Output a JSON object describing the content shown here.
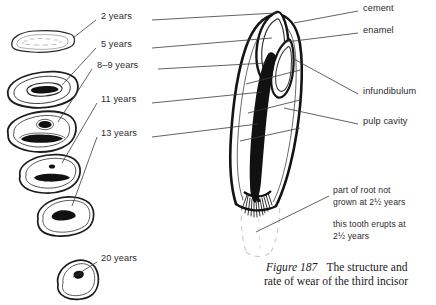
{
  "figure": {
    "caption_label": "Figure 187",
    "caption_text": "The structure and",
    "caption_text2": "rate of wear of the third incisor"
  },
  "wear_series": {
    "title": "third incisor wear stages",
    "stages": [
      {
        "id": "stage-2-years",
        "label": "2 years",
        "label_x": 101,
        "label_y": 16,
        "line_x1": 96,
        "line_y1": 20,
        "line_x2": 73,
        "line_y2": 38
      },
      {
        "id": "stage-5-years",
        "label": "5 years",
        "label_x": 101,
        "label_y": 44,
        "line_x1": 96,
        "line_y1": 48,
        "line_x2": 62,
        "line_y2": 85
      },
      {
        "id": "stage-8-9-years",
        "label": "8–9 years",
        "label_x": 97,
        "label_y": 63,
        "line_x1": 92,
        "line_y1": 68,
        "line_x2": 58,
        "line_y2": 122
      },
      {
        "id": "stage-11-years",
        "label": "11 years",
        "label_x": 101,
        "label_y": 98,
        "line_x1": 97,
        "line_y1": 103,
        "line_x2": 62,
        "line_y2": 163
      },
      {
        "id": "stage-13-years",
        "label": "13 years",
        "label_x": 101,
        "label_y": 131,
        "line_x1": 97,
        "line_y1": 136,
        "line_x2": 72,
        "line_y2": 205
      },
      {
        "id": "stage-20-years",
        "label": "20 years",
        "label_x": 101,
        "label_y": 258,
        "line_x1": 97,
        "line_y1": 262,
        "line_x2": 72,
        "line_y2": 277
      }
    ]
  },
  "structure_labels": [
    {
      "id": "label-cement",
      "label": "cement",
      "x": 363,
      "y": 7,
      "line_x1": 358,
      "line_y1": 11,
      "line_x2": 296,
      "line_y2": 24
    },
    {
      "id": "label-enamel",
      "label": "enamel",
      "x": 363,
      "y": 29,
      "line_x1": 358,
      "line_y1": 33,
      "line_x2": 288,
      "line_y2": 41
    },
    {
      "id": "label-infundibulum",
      "label": "infundibulum",
      "x": 363,
      "y": 90,
      "line_x1": 358,
      "line_y1": 94,
      "line_x2": 290,
      "line_y2": 57
    },
    {
      "id": "label-pulp-cavity",
      "label": "pulp cavity",
      "x": 363,
      "y": 120,
      "line_x1": 358,
      "line_y1": 124,
      "line_x2": 282,
      "line_y2": 107
    }
  ],
  "left_leader_lines": [
    {
      "id": "leader-cement-left",
      "x1": 155,
      "y1": 20,
      "x2": 272,
      "y2": 13
    },
    {
      "id": "leader-enamel-left",
      "x1": 155,
      "y1": 48,
      "x2": 268,
      "y2": 37
    },
    {
      "id": "leader-stage89-left",
      "x1": 160,
      "y1": 68,
      "x2": 262,
      "y2": 62
    },
    {
      "id": "leader-11-left",
      "x1": 155,
      "y1": 103,
      "x2": 258,
      "y2": 90
    },
    {
      "id": "leader-13-left",
      "x1": 155,
      "y1": 136,
      "x2": 256,
      "y2": 121
    }
  ],
  "annotations": [
    {
      "id": "note-root-not-grown",
      "line1": "part of root not",
      "line2": "grown at 2½ years",
      "x": 333,
      "y": 188,
      "line_x1": 329,
      "line_y1": 196,
      "line_x2": 256,
      "line_y2": 232
    },
    {
      "id": "note-tooth-erupts",
      "line1": "this tooth erupts at",
      "line2": "2½ years",
      "x": 333,
      "y": 222,
      "line_x1": 0,
      "line_y1": 0,
      "line_x2": 0,
      "line_y2": 0
    }
  ],
  "colors": {
    "ink": "#1a1a1a",
    "line": "#3a3a3a",
    "faint": "#b8b8b8",
    "paper": "#ffffff",
    "fill_dark": "#111111"
  },
  "cross_sections": [
    {
      "id": "xs-2-years",
      "age": "2 years",
      "wear": "unworn, elongated oval with stippled enamel"
    },
    {
      "id": "xs-5-years",
      "age": "5 years",
      "wear": "triangular, long dark infundibulum"
    },
    {
      "id": "xs-8-9-years",
      "age": "8–9 years",
      "wear": "dark dot plus long infundibulum bar"
    },
    {
      "id": "xs-11-years",
      "age": "11 years",
      "wear": "small dot above shortening bar"
    },
    {
      "id": "xs-13-years",
      "age": "13 years",
      "wear": "short thick dark mark"
    },
    {
      "id": "xs-20-years",
      "age": "20 years",
      "wear": "small rounded triangle with tiny dot"
    }
  ]
}
